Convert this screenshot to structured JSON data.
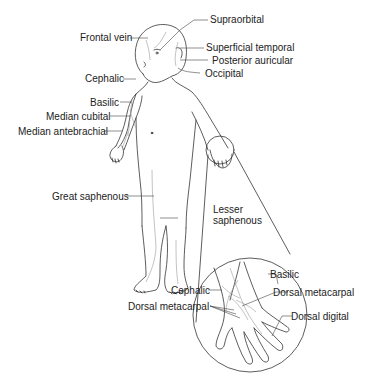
{
  "figure": {
    "labels": {
      "supraorbital": "Supraorbital",
      "frontal_vein": "Frontal vein",
      "superficial_temporal": "Superficial temporal",
      "posterior_auricular": "Posterior auricular",
      "occipital": "Occipital",
      "cephalic": "Cephalic",
      "basilic": "Basilic",
      "median_cubital": "Median cubital",
      "median_antebrachial": "Median antebrachial",
      "great_saphenous": "Great saphenous",
      "lesser_saphenous_1": "Lesser",
      "lesser_saphenous_2": "saphenous"
    },
    "inset": {
      "cephalic": "Cephalic",
      "basilic": "Basilic",
      "dorsal_metacarpal_right": "Dorsal metacarpal",
      "dorsal_metacarpal_left": "Dorsal metacarpal",
      "dorsal_digital": "Dorsal digital"
    },
    "colors": {
      "outline": "#333333",
      "vein": "#9a9a9a",
      "leader": "#444444",
      "text": "#222222"
    }
  }
}
